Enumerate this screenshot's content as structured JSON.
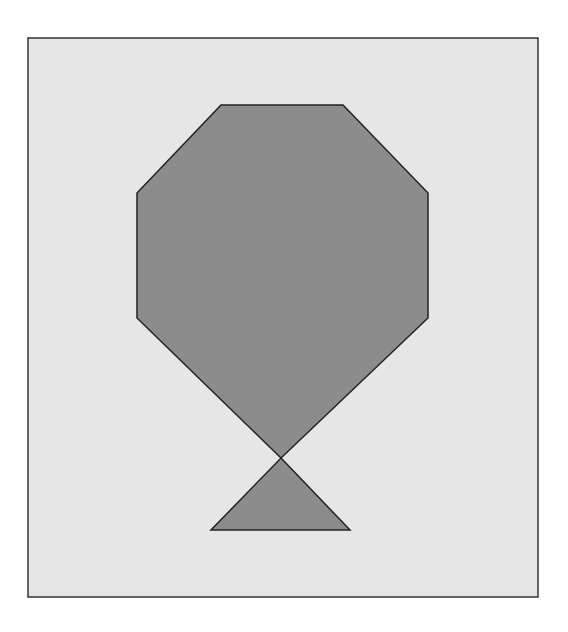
{
  "canvas": {
    "width": 568,
    "height": 632,
    "page_color": "#ffffff"
  },
  "frame": {
    "x": 28,
    "y": 38,
    "width": 510,
    "height": 559,
    "fill": "#e6e6e6",
    "stroke": "#333333",
    "stroke_width": 1.5
  },
  "shapes": {
    "octagon_body": {
      "label": "octagon",
      "fill": "#8c8c8c",
      "stroke": "#222222",
      "points": "221,105 343,105 428,193 428,318 281,458 137,318 137,193"
    },
    "triangle_base": {
      "label": "triangle",
      "fill": "#8c8c8c",
      "stroke": "#222222",
      "points": "281,458 350,530 211,530"
    }
  },
  "crossing_point": {
    "x": 281,
    "y": 458
  }
}
